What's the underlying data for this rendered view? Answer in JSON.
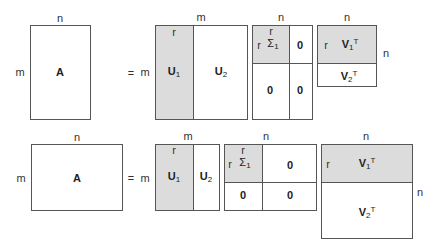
{
  "top": {
    "A": {
      "label": "A",
      "rows": "m",
      "cols": "n"
    },
    "equals": "=",
    "U": {
      "rows": "m",
      "cols": "m",
      "rank": "r",
      "U1": "U",
      "U1_sub": "1",
      "U2": "U",
      "U2_sub": "2"
    },
    "Sigma": {
      "cols": "n",
      "rank_row": "r",
      "rank_col": "r",
      "S1": "Σ",
      "S1_sub": "1",
      "z_tr": "0",
      "z_bl": "0",
      "z_br": "0"
    },
    "V": {
      "cols": "n",
      "rows": "n",
      "rank": "r",
      "V1": "V",
      "V1_sub": "1",
      "V1_sup": "T",
      "V2": "V",
      "V2_sub": "2",
      "V2_sup": "T"
    }
  },
  "bottom": {
    "A": {
      "label": "A",
      "rows": "m",
      "cols": "n"
    },
    "equals": "=",
    "U": {
      "rows": "m",
      "cols": "m",
      "rank": "r",
      "U1": "U",
      "U1_sub": "1",
      "U2": "U",
      "U2_sub": "2"
    },
    "Sigma": {
      "cols": "n",
      "rank_row": "r",
      "rank_col": "r",
      "S1": "Σ",
      "S1_sub": "1",
      "z_tr": "0",
      "z_bl": "0",
      "z_br": "0"
    },
    "V": {
      "cols": "n",
      "rows": "n",
      "rank": "r",
      "V1": "V",
      "V1_sub": "1",
      "V1_sup": "T",
      "V2": "V",
      "V2_sub": "2",
      "V2_sup": "T"
    }
  }
}
